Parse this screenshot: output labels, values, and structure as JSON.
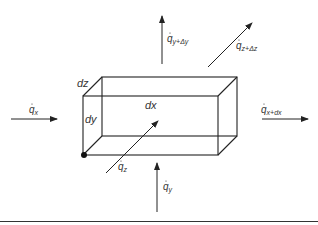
{
  "diagram": {
    "box_labels": {
      "dx": "dx",
      "dy": "dy",
      "dz": "dz"
    },
    "flux_labels": {
      "qx": {
        "base": "q",
        "sub": "x"
      },
      "qx_dx": {
        "base": "q",
        "sub": "x+dx"
      },
      "qy": {
        "base": "q",
        "sub": "y"
      },
      "qy_dy": {
        "base": "q",
        "sub": "y+Δy"
      },
      "qz": {
        "base": "q",
        "sub": "z"
      },
      "qz_dz": {
        "base": "q",
        "sub": "z+Δz"
      }
    },
    "colors": {
      "stroke": "#222222",
      "text": "#333333"
    }
  }
}
